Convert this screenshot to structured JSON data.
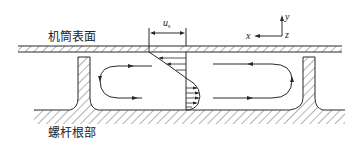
{
  "labels": {
    "barrel_surface": "机筒表面",
    "screw_root": "螺杆根部",
    "velocity_symbol": "u",
    "velocity_subscript": "s",
    "axis_x": "x",
    "axis_y": "y",
    "axis_z": "z"
  },
  "colors": {
    "line": "#2a2a2a",
    "hatch": "#555555",
    "background": "#ffffff"
  },
  "elements": {
    "barrel": "barrel wall with hatching (moving at u_s)",
    "flights": [
      "left screw flight",
      "right screw flight"
    ],
    "circulation_loops": [
      "left recirculation loop",
      "right recirculation loop"
    ],
    "velocity_profile": "cross-channel velocity profile with arrows",
    "coordinate_axes": "x-y-z axes indicator"
  }
}
